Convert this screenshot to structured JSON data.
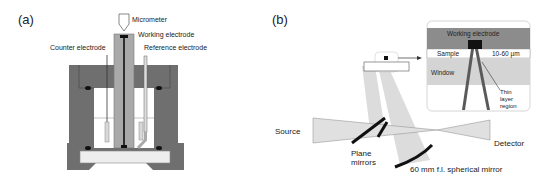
{
  "panel_a": {
    "label": "(a)",
    "annotations": {
      "micrometer": "Micrometer",
      "working_electrode": "Working electrode",
      "counter_electrode": "Counter electrode",
      "reference_electrode": "Reference electrode"
    }
  },
  "panel_b": {
    "label": "(b)",
    "inset": {
      "working_electrode": "Working electrode",
      "sample": "Sample",
      "thickness": "10-60 µm",
      "window": "Window",
      "thin_layer_1": "Thin",
      "thin_layer_2": "layer",
      "thin_layer_3": "region"
    },
    "source": "Source",
    "detector": "Detector",
    "plane_mirrors_1": "Plane",
    "plane_mirrors_2": "mirrors",
    "spherical_mirror": "60 mm f.l. spherical mirror"
  },
  "colors": {
    "dark_gray": "#6f6f6f",
    "mid_gray": "#a9a9a9",
    "light_gray": "#d4d4d4",
    "beam": "#dcdcdc",
    "black": "#111111"
  }
}
